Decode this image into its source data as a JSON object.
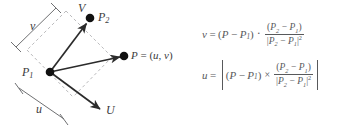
{
  "figure": {
    "background_color": "#ffffff",
    "ink_color": "#58595b",
    "diagram": {
      "points": [
        {
          "id": "P1",
          "label": "P",
          "subscript": "1",
          "x": 50,
          "y": 72
        },
        {
          "id": "P2",
          "label": "P",
          "subscript": "2",
          "x": 90,
          "y": 18
        },
        {
          "id": "P",
          "label": "P",
          "subscript": "",
          "x": 124,
          "y": 56
        }
      ],
      "axis_labels": [
        {
          "id": "V",
          "label": "V"
        },
        {
          "id": "U",
          "label": "U"
        }
      ],
      "point_label": {
        "prefix": "P",
        "equals": " = (",
        "u": "u",
        "sep": ", ",
        "v": "v",
        "suffix": ")"
      },
      "dimension_labels": [
        {
          "id": "v",
          "label": "v"
        },
        {
          "id": "u",
          "label": "u"
        }
      ],
      "solid_line_color": "#2b2b2b",
      "dashed_line_color": "#b9b9bb",
      "dot_color": "#111111"
    },
    "equations": [
      {
        "id": "equation-v",
        "lhs": "v",
        "equals": "=",
        "left_factor": {
          "open": "(",
          "a": "P",
          "a_sub": "",
          "op": "−",
          "b": "P",
          "b_sub": "1",
          "close": ")"
        },
        "operator": "·",
        "operator_name": "dot-product",
        "fraction": {
          "numerator": {
            "open": "(",
            "a": "P",
            "a_sub": "2",
            "op": "−",
            "b": "P",
            "b_sub": "1",
            "close": ")"
          },
          "denominator": {
            "open": "|",
            "a": "P",
            "a_sub": "2",
            "op": "−",
            "b": "P",
            "b_sub": "1",
            "close": "|",
            "exponent": "2"
          }
        },
        "absolute_value": false
      },
      {
        "id": "equation-u",
        "lhs": "u",
        "equals": "=",
        "left_factor": {
          "open": "(",
          "a": "P",
          "a_sub": "",
          "op": "−",
          "b": "P",
          "b_sub": "1",
          "close": ")"
        },
        "operator": "×",
        "operator_name": "cross-product",
        "fraction": {
          "numerator": {
            "open": "(",
            "a": "P",
            "a_sub": "2",
            "op": "−",
            "b": "P",
            "b_sub": "1",
            "close": ")"
          },
          "denominator": {
            "open": "|",
            "a": "P",
            "a_sub": "2",
            "op": "−",
            "b": "P",
            "b_sub": "1",
            "close": "|",
            "exponent": "2"
          }
        },
        "absolute_value": true
      }
    ]
  }
}
